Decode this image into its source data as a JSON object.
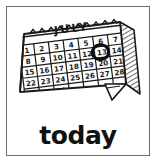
{
  "card": {
    "caption": "today",
    "frame_color": "#6d6d6d",
    "background_color": "#ffffff",
    "ink_color": "#111111"
  },
  "illustration": {
    "name": "wall-calendar",
    "style": "black-and-white clip art, tilted, hatched page-edge shading, curled bottom-right corner, scalloped binding tabs on top"
  },
  "calendar": {
    "month_label": "JULY",
    "highlighted_day": "13",
    "highlight_style": "hand-drawn circle",
    "columns": 7,
    "weeks": [
      [
        "1",
        "2",
        "3",
        "4",
        "5",
        "6",
        "7"
      ],
      [
        "8",
        "9",
        "10",
        "11",
        "12",
        "13",
        "14"
      ],
      [
        "15",
        "16",
        "17",
        "18",
        "19",
        "20",
        "21"
      ],
      [
        "22",
        "23",
        "24",
        "25",
        "26",
        "27",
        "28"
      ],
      [
        "29",
        "30",
        "31",
        "",
        "",
        "",
        ""
      ]
    ]
  }
}
